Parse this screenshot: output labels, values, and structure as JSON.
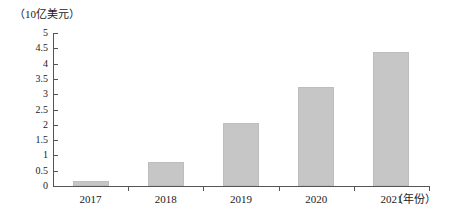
{
  "chart_data": {
    "type": "bar",
    "title": "",
    "subtitle": "",
    "xlabel": "（年份）",
    "ylabel": "（10亿美元）",
    "categories": [
      "2017",
      "2018",
      "2019",
      "2020",
      "2021"
    ],
    "values": [
      0.16,
      0.8,
      2.06,
      3.24,
      4.38
    ],
    "series": [
      {
        "name": "",
        "values": [
          0.16,
          0.8,
          2.06,
          3.24,
          4.38
        ]
      }
    ],
    "ylim": [
      0,
      5
    ],
    "ytick_labels": [
      "0",
      "0.5",
      "1",
      "1.5",
      "2",
      "2.5",
      "3",
      "3.5",
      "4",
      "4.5",
      "5"
    ],
    "ytick_values": [
      0,
      0.5,
      1,
      1.5,
      2,
      2.5,
      3,
      3.5,
      4,
      4.5,
      5
    ],
    "xtick_labels": [
      "2017",
      "2018",
      "2019",
      "2020",
      "2021"
    ],
    "grid": false,
    "legend": false,
    "legend_position": "none",
    "bar_color": "#c6c6c6",
    "axis_color": "#555555",
    "background_color": "#ffffff",
    "annotations": []
  },
  "axis": {
    "y_unit_caption": "（10亿美元）",
    "x_unit_caption": "（年份）"
  }
}
